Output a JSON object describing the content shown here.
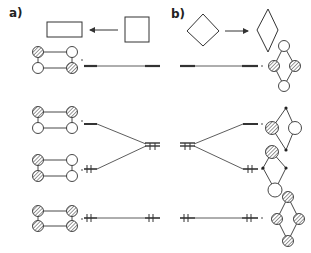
{
  "panels": {
    "a": {
      "label": "a)"
    },
    "b": {
      "label": "b)"
    }
  },
  "colors": {
    "stroke": "#333333",
    "background": "#ffffff",
    "hatch": "#555555"
  },
  "diagram": {
    "top_shapes": {
      "a": [
        "rectangle",
        "arrow-left",
        "square"
      ],
      "b": [
        "diamond",
        "arrow-right",
        "rhombus"
      ]
    },
    "left_molecules": [
      {
        "row": 1,
        "circles": [
          "hatched",
          "open",
          "open",
          "hatched"
        ]
      },
      {
        "row": 2,
        "circles": [
          "hatched",
          "hatched",
          "open",
          "open"
        ]
      },
      {
        "row": 3,
        "circles": [
          "hatched",
          "open",
          "hatched",
          "open"
        ]
      },
      {
        "row": 4,
        "circles": [
          "hatched",
          "hatched",
          "hatched",
          "hatched"
        ]
      }
    ],
    "right_molecules": [
      {
        "row": 1,
        "nodes": [
          "open",
          "hatched",
          "hatched",
          "open"
        ]
      },
      {
        "row": 2,
        "nodes": [
          "dot",
          "hatched",
          "open",
          "dot"
        ]
      },
      {
        "row": 3,
        "nodes": [
          "hatched",
          "dot",
          "dot",
          "open"
        ]
      },
      {
        "row": 4,
        "nodes": [
          "hatched",
          "hatched",
          "hatched",
          "hatched"
        ]
      }
    ],
    "energy_levels": {
      "left": [
        {
          "level": 1,
          "occupancy": "empty",
          "marks": "—"
        },
        {
          "level": 2,
          "occupancy": "empty",
          "marks": "—"
        },
        {
          "level": 3,
          "occupancy": "doubly-occupied",
          "marks": "ǂǂ"
        },
        {
          "level": 4,
          "occupancy": "doubly-occupied",
          "marks": "ǂǂ"
        }
      ],
      "center": [
        {
          "level": "degenerate",
          "occupancy": "half-filled",
          "marks": "ǂǂ"
        }
      ]
    }
  }
}
